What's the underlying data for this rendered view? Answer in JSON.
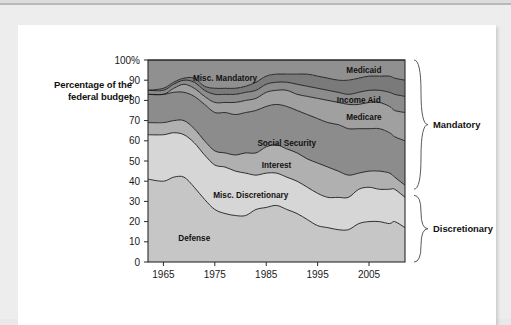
{
  "page": {
    "background_color": "#ededed",
    "card_color": "#ffffff"
  },
  "figure": {
    "y_axis_title_line1": "Percentage of the",
    "y_axis_title_line2": "federal budget"
  },
  "chart_data": {
    "type": "area",
    "stacked": true,
    "title": "",
    "xlabel": "",
    "ylabel": "Percentage of the federal budget",
    "xlim": [
      1962,
      2012
    ],
    "ylim": [
      0,
      100
    ],
    "grid": false,
    "legend_position": "inline-labels",
    "x_ticks": [
      1965,
      1975,
      1985,
      1995,
      2005
    ],
    "y_ticks": [
      "0",
      "10",
      "20",
      "30",
      "40",
      "50",
      "60",
      "70",
      "80",
      "90",
      "100%"
    ],
    "y_tick_values": [
      0,
      10,
      20,
      30,
      40,
      50,
      60,
      70,
      80,
      90,
      100
    ],
    "x": [
      1962,
      1965,
      1967,
      1969,
      1971,
      1973,
      1975,
      1977,
      1979,
      1981,
      1983,
      1985,
      1987,
      1989,
      1991,
      1993,
      1995,
      1997,
      1999,
      2001,
      2003,
      2005,
      2007,
      2009,
      2010,
      2012
    ],
    "series": [
      {
        "name": "Defense",
        "group": "Discretionary",
        "color": "#c6c6c6",
        "label_x": 1971,
        "label_y": 12,
        "values": [
          41,
          40,
          42,
          42,
          37,
          31,
          26,
          24,
          23,
          23,
          26,
          27,
          28,
          26,
          24,
          21,
          18,
          17,
          16,
          16,
          19,
          20,
          20,
          19,
          20,
          17
        ]
      },
      {
        "name": "Misc. Discretionary",
        "group": "Discretionary",
        "color": "#d6d6d6",
        "label_x": 1982,
        "label_y": 33,
        "values": [
          22,
          23,
          22,
          21,
          22,
          22,
          22,
          23,
          22,
          21,
          17,
          17,
          16,
          16,
          16,
          16,
          16,
          15,
          16,
          16,
          17,
          17,
          16,
          17,
          16,
          15
        ]
      },
      {
        "name": "Interest",
        "group": "Mandatory",
        "color": "#b0b0b0",
        "label_x": 1987,
        "label_y": 48,
        "values": [
          6,
          6,
          6,
          7,
          7,
          7,
          7,
          7,
          8,
          10,
          11,
          13,
          14,
          14,
          14,
          14,
          15,
          15,
          13,
          11,
          8,
          8,
          9,
          8,
          6,
          6
        ]
      },
      {
        "name": "Social Security",
        "group": "Mandatory",
        "color": "#8c8c8c",
        "label_x": 1989,
        "label_y": 59,
        "values": [
          14,
          14,
          14,
          14,
          16,
          18,
          19,
          20,
          20,
          20,
          21,
          20,
          20,
          21,
          21,
          22,
          22,
          22,
          23,
          23,
          22,
          21,
          21,
          20,
          20,
          22
        ]
      },
      {
        "name": "Medicare",
        "group": "Mandatory",
        "color": "#a0a0a0",
        "label_x": 2004,
        "label_y": 72,
        "values": [
          0,
          0,
          2,
          4,
          4,
          4,
          5,
          5,
          6,
          6,
          6,
          7,
          7,
          8,
          8,
          9,
          10,
          11,
          11,
          12,
          12,
          13,
          13,
          13,
          13,
          14
        ]
      },
      {
        "name": "Income Aid",
        "group": "Mandatory",
        "color": "#8c8c8c",
        "label_x": 2003,
        "label_y": 80,
        "values": [
          2,
          2,
          2,
          2,
          3,
          3,
          4,
          4,
          4,
          4,
          4,
          4,
          4,
          4,
          5,
          5,
          5,
          5,
          5,
          5,
          6,
          6,
          6,
          7,
          8,
          8
        ]
      },
      {
        "name": "Medicaid",
        "group": "Mandatory",
        "color": "#7a7a7a",
        "label_x": 2004,
        "label_y": 95,
        "values": [
          0,
          1,
          1,
          1,
          2,
          2,
          3,
          3,
          3,
          3,
          4,
          4,
          4,
          4,
          5,
          6,
          6,
          6,
          6,
          7,
          7,
          7,
          7,
          8,
          8,
          8
        ]
      },
      {
        "name": "Misc. Mandatory",
        "group": "Mandatory",
        "color": "#909090",
        "label_x": 1977,
        "label_y": 91,
        "values": [
          15,
          14,
          11,
          9,
          9,
          13,
          14,
          14,
          14,
          13,
          11,
          8,
          7,
          7,
          7,
          7,
          8,
          9,
          10,
          10,
          9,
          8,
          8,
          8,
          9,
          10
        ]
      }
    ],
    "annotations": [
      {
        "name": "Mandatory",
        "y_from": 36,
        "y_to": 100
      },
      {
        "name": "Discretionary",
        "y_from": 0,
        "y_to": 33
      }
    ]
  }
}
